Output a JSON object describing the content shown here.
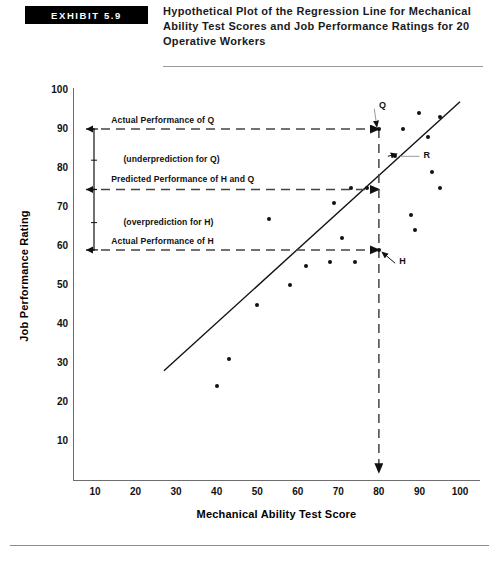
{
  "header": {
    "exhibit_label": "EXHIBIT 5.9",
    "title": "Hypothetical Plot of the Regression Line for Mechanical Ability Test Scores and Job Performance Ratings for 20 Operative Workers"
  },
  "chart_data": {
    "type": "scatter",
    "title": "Hypothetical Plot of the Regression Line for Mechanical Ability Test Scores and Job Performance Ratings for 20 Operative Workers",
    "xlabel": "Mechanical Ability Test Score",
    "ylabel": "Job Performance Rating",
    "xlim": [
      0,
      104
    ],
    "ylim": [
      0,
      104
    ],
    "xticks": [
      10,
      20,
      30,
      40,
      50,
      60,
      70,
      80,
      90,
      100
    ],
    "yticks": [
      10,
      20,
      30,
      40,
      50,
      60,
      70,
      80,
      90,
      100
    ],
    "grid": false,
    "legend": null,
    "points": [
      {
        "x": 40,
        "y": 24
      },
      {
        "x": 43,
        "y": 31
      },
      {
        "x": 50,
        "y": 45
      },
      {
        "x": 53,
        "y": 67
      },
      {
        "x": 58,
        "y": 50
      },
      {
        "x": 62,
        "y": 55
      },
      {
        "x": 68,
        "y": 56
      },
      {
        "x": 69,
        "y": 71
      },
      {
        "x": 71,
        "y": 62
      },
      {
        "x": 73,
        "y": 75
      },
      {
        "x": 74,
        "y": 56
      },
      {
        "x": 77,
        "y": 75
      },
      {
        "x": 80,
        "y": 90,
        "label": "Q"
      },
      {
        "x": 80,
        "y": 59,
        "label": "H"
      },
      {
        "x": 84,
        "y": 83,
        "label": "R"
      },
      {
        "x": 86,
        "y": 90
      },
      {
        "x": 88,
        "y": 68
      },
      {
        "x": 89,
        "y": 64
      },
      {
        "x": 90,
        "y": 94
      },
      {
        "x": 92,
        "y": 88
      },
      {
        "x": 93,
        "y": 79
      },
      {
        "x": 95,
        "y": 93
      },
      {
        "x": 95,
        "y": 75
      }
    ],
    "regression_line": {
      "x1": 27,
      "y1": 28,
      "x2": 100,
      "y2": 97
    },
    "reference_lines": [
      {
        "value": 90,
        "orientation": "horizontal",
        "style": "dashed",
        "label": "Actual Performance of Q"
      },
      {
        "value": 74.5,
        "orientation": "horizontal",
        "style": "dashed",
        "label": "Predicted Performance of H and Q"
      },
      {
        "value": 59,
        "orientation": "horizontal",
        "style": "dashed",
        "label": "Actual Performance of H"
      },
      {
        "value": 80,
        "orientation": "vertical",
        "style": "dashed",
        "label": ""
      }
    ],
    "annotations": [
      {
        "text": "Actual Performance of Q",
        "x": 14,
        "y": 92
      },
      {
        "text": "(underprediction for Q)",
        "x": 17,
        "y": 82
      },
      {
        "text": "Predicted Performance of H and Q",
        "x": 14,
        "y": 77
      },
      {
        "text": "(overprediction for H)",
        "x": 17,
        "y": 66
      },
      {
        "text": "Actual Performance of H",
        "x": 14,
        "y": 61
      },
      {
        "text": "Q",
        "x": 80,
        "y": 96
      },
      {
        "text": "R",
        "x": 91,
        "y": 83
      },
      {
        "text": "H",
        "x": 85,
        "y": 56
      }
    ]
  }
}
